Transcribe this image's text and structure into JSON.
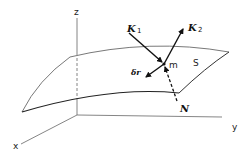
{
  "diagram": {
    "axes": {
      "x_label": "x",
      "y_label": "y",
      "z_label": "z"
    },
    "surface": {
      "label": "S"
    },
    "point": {
      "label": "m"
    },
    "vectors": {
      "k1": {
        "symbol": "K",
        "subscript": "1"
      },
      "k2": {
        "symbol": "K",
        "subscript": "2"
      },
      "delta_r": {
        "symbol": "δr"
      },
      "normal": {
        "symbol": "N",
        "style": "dashed"
      }
    },
    "colors": {
      "line": "#333333",
      "thin_line": "#666666",
      "background": "#ffffff"
    }
  }
}
